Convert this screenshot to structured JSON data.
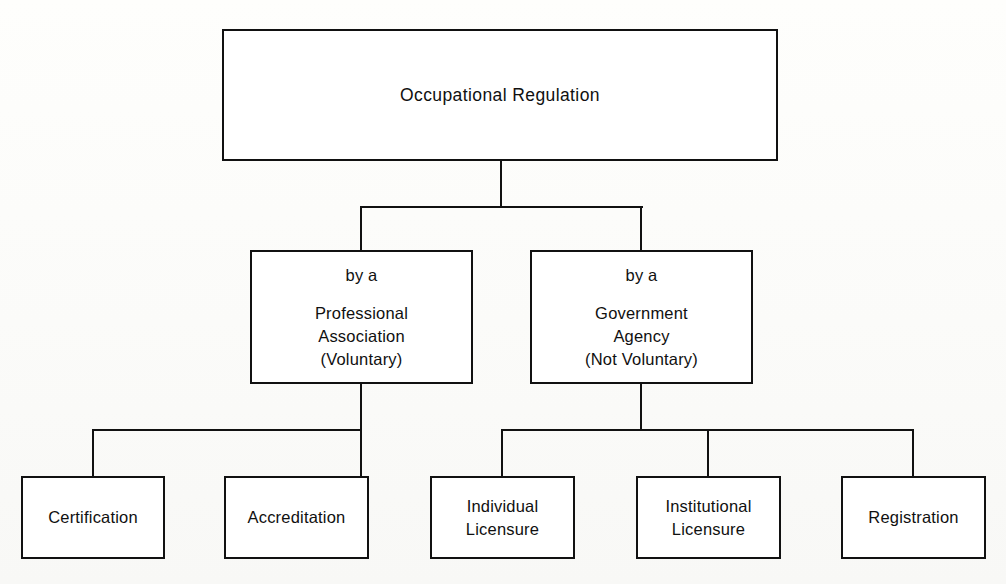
{
  "diagram": {
    "type": "hierarchy-tree",
    "title_node": {
      "id": "occupational-regulation",
      "label": "Occupational Regulation",
      "lines": [
        "Occupational Regulation"
      ]
    },
    "level2": [
      {
        "id": "professional-association",
        "prefix": "by a",
        "lines": [
          "Professional",
          "Association",
          "(Voluntary)"
        ],
        "label": "by a Professional Association (Voluntary)"
      },
      {
        "id": "government-agency",
        "prefix": "by a",
        "lines": [
          "Government",
          "Agency",
          "(Not Voluntary)"
        ],
        "label": "by a Government Agency (Not Voluntary)"
      }
    ],
    "level3": [
      {
        "id": "certification",
        "parent": "professional-association",
        "lines": [
          "Certification"
        ],
        "label": "Certification"
      },
      {
        "id": "accreditation",
        "parent": "professional-association",
        "lines": [
          "Accreditation"
        ],
        "label": "Accreditation"
      },
      {
        "id": "individual-licensure",
        "parent": "government-agency",
        "lines": [
          "Individual",
          "Licensure"
        ],
        "label": "Individual Licensure"
      },
      {
        "id": "institutional-licensure",
        "parent": "government-agency",
        "lines": [
          "Institutional",
          "Licensure"
        ],
        "label": "Institutional Licensure"
      },
      {
        "id": "registration",
        "parent": "government-agency",
        "lines": [
          "Registration"
        ],
        "label": "Registration"
      }
    ],
    "colors": {
      "stroke": "#111111",
      "box_fill": "#ffffff",
      "background": "#fdfdfb"
    }
  }
}
